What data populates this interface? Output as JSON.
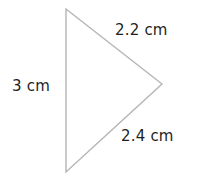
{
  "diagram": {
    "shape": "triangle",
    "stroke_color": "#b5b5b5",
    "vertices": [
      [
        66,
        9
      ],
      [
        162,
        84
      ],
      [
        66,
        172
      ]
    ],
    "labels": {
      "left_side": "3 cm",
      "top_side": "2.2 cm",
      "bottom_side": "2.4 cm"
    }
  }
}
